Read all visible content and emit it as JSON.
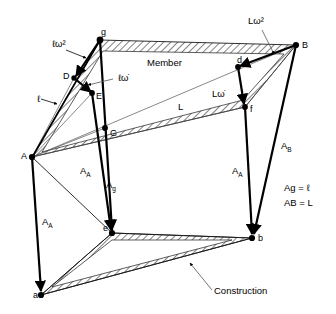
{
  "diagram": {
    "regions": [
      {
        "id": "member",
        "label": "Member"
      },
      {
        "id": "construction",
        "label": "Construction"
      }
    ],
    "points": [
      {
        "id": "A",
        "label": "A",
        "x": 32,
        "y": 157,
        "label_dx": -11,
        "label_dy": 2
      },
      {
        "id": "B",
        "label": "B",
        "x": 296,
        "y": 45,
        "label_dx": 6,
        "label_dy": 3
      },
      {
        "id": "g",
        "label": "g",
        "x": 100,
        "y": 40,
        "label_dx": 1,
        "label_dy": -5
      },
      {
        "id": "D",
        "label": "D",
        "x": 74,
        "y": 78,
        "label_dx": -11,
        "label_dy": 1
      },
      {
        "id": "E",
        "label": "E",
        "x": 92,
        "y": 93,
        "label_dx": 4,
        "label_dy": 6
      },
      {
        "id": "G",
        "label": "G",
        "x": 105,
        "y": 128,
        "label_dx": 5,
        "label_dy": 8
      },
      {
        "id": "d",
        "label": "d",
        "x": 238,
        "y": 67,
        "label_dx": -1,
        "label_dy": -4
      },
      {
        "id": "f",
        "label": "f",
        "x": 245,
        "y": 107,
        "label_dx": 5,
        "label_dy": 5
      },
      {
        "id": "e",
        "label": "e",
        "x": 112,
        "y": 233,
        "label_dx": -9,
        "label_dy": -2
      },
      {
        "id": "b",
        "label": "b",
        "x": 252,
        "y": 238,
        "label_dx": 6,
        "label_dy": 3
      },
      {
        "id": "a",
        "label": "a",
        "x": 41,
        "y": 295,
        "label_dx": -8,
        "label_dy": 3
      }
    ],
    "vectors": [
      {
        "id": "l-omega-sq",
        "label": "ℓω²",
        "from": "g",
        "to": "D",
        "label_x": 52,
        "label_y": 47
      },
      {
        "id": "l-omega-dot",
        "label": "ℓω̇",
        "from": "D",
        "to": "E",
        "label_x": 118,
        "label_y": 81
      },
      {
        "id": "l-length",
        "label": "ℓ",
        "from": "A",
        "to": "g",
        "label_x": 40,
        "label_y": 100
      },
      {
        "id": "L-omega-sq",
        "label": "Lω²",
        "from": "B",
        "to": "d",
        "label_x": 248,
        "label_y": 24
      },
      {
        "id": "L-omega-dot",
        "label": "Lω̇",
        "from": "d",
        "to": "f",
        "label_x": 216,
        "label_y": 95
      },
      {
        "id": "L-length",
        "label": "L",
        "from": "A",
        "to": "B",
        "label_x": 178,
        "label_y": 108
      },
      {
        "id": "A-A-left",
        "label": "A",
        "sub": "A",
        "from": "A",
        "to": "a",
        "label_x": 47,
        "label_y": 223
      },
      {
        "id": "A-A-mid",
        "label": "A",
        "sub": "A",
        "from": "E",
        "to": "e",
        "label_x": 85,
        "label_y": 172
      },
      {
        "id": "A-g",
        "label": "A",
        "sub": "g",
        "from": "g",
        "to": "e",
        "label_x": 110,
        "label_y": 186
      },
      {
        "id": "A-A-right",
        "label": "A",
        "sub": "A",
        "from": "f",
        "to": "b",
        "label_x": 236,
        "label_y": 172
      },
      {
        "id": "A-B",
        "label": "A",
        "sub": "B",
        "from": "B",
        "to": "b",
        "label_x": 285,
        "label_y": 147
      }
    ],
    "equations": [
      {
        "id": "Ag-eq",
        "text": "Ag = ℓ"
      },
      {
        "id": "AB-eq",
        "text": "AB = L"
      }
    ]
  }
}
